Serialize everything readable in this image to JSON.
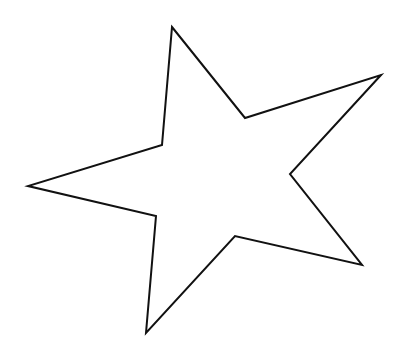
{
  "canvas": {
    "width": 400,
    "height": 357,
    "background": "#ffffff"
  },
  "star": {
    "shape": "five-pointed-star-outline",
    "stroke_color": "#111111",
    "stroke_width": 2,
    "fill_color": "#ffffff",
    "points": "172,27 245,118 381,75 290,174 362,265 235,236 146,333 156,216 28,186 162,145",
    "vertices": {
      "tips": [
        {
          "name": "top",
          "x": 172,
          "y": 27
        },
        {
          "name": "right",
          "x": 381,
          "y": 75
        },
        {
          "name": "lower-right",
          "x": 362,
          "y": 265
        },
        {
          "name": "bottom",
          "x": 146,
          "y": 333
        },
        {
          "name": "left",
          "x": 28,
          "y": 186
        }
      ],
      "inner": [
        {
          "x": 245,
          "y": 118
        },
        {
          "x": 290,
          "y": 174
        },
        {
          "x": 235,
          "y": 236
        },
        {
          "x": 156,
          "y": 216
        },
        {
          "x": 162,
          "y": 145
        }
      ]
    }
  }
}
